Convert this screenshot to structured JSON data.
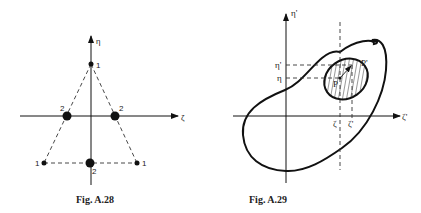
{
  "figures": [
    {
      "caption": "Fig. A.28",
      "axes": {
        "horizontal": "ζ",
        "vertical": "η"
      },
      "nodes": [
        {
          "label": "1",
          "position": "top vertex"
        },
        {
          "label": "1",
          "position": "bottom-left vertex"
        },
        {
          "label": "1",
          "position": "bottom-right vertex"
        },
        {
          "label": "2",
          "position": "left edge midpoint"
        },
        {
          "label": "2",
          "position": "right edge midpoint"
        },
        {
          "label": "2",
          "position": "bottom edge midpoint"
        }
      ]
    },
    {
      "caption": "Fig. A.29",
      "axes": {
        "horizontal": "ζ'",
        "vertical": "η'"
      },
      "labels": {
        "eta_prime": "η'",
        "eta": "η",
        "zeta": "ζ",
        "zeta_prime": "ζ'",
        "P": "P",
        "P_prime": "P'"
      }
    }
  ]
}
